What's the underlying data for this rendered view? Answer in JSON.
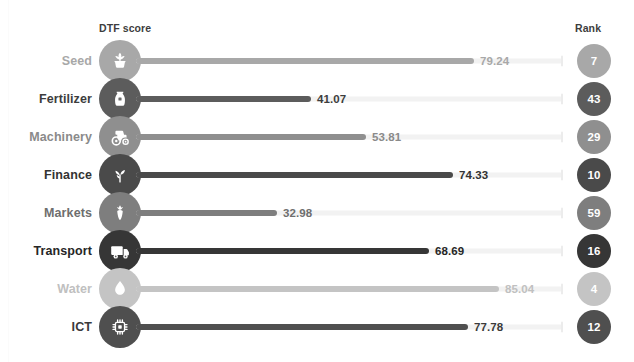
{
  "header": {
    "score_label": "DTF score",
    "rank_label": "Rank"
  },
  "chart_data": {
    "type": "bar",
    "title": "",
    "subtitle": "",
    "xlabel": "DTF score",
    "ylabel": "",
    "xlim": [
      0,
      100
    ],
    "grid": false,
    "legend": null,
    "orientation": "horizontal",
    "categories": [
      "Seed",
      "Fertilizer",
      "Machinery",
      "Finance",
      "Markets",
      "Transport",
      "Water",
      "ICT"
    ],
    "values": [
      79.24,
      41.07,
      53.81,
      74.33,
      32.98,
      68.69,
      85.04,
      77.78
    ],
    "ranks": [
      7,
      43,
      29,
      10,
      59,
      16,
      4,
      12
    ],
    "value_labels": [
      "79.24",
      "41.07",
      "53.81",
      "74.33",
      "32.98",
      "68.69",
      "85.04",
      "77.78"
    ],
    "rank_labels": [
      "7",
      "43",
      "29",
      "10",
      "59",
      "16",
      "4",
      "12"
    ],
    "series": [
      {
        "name": "DTF score",
        "values": [
          79.24,
          41.07,
          53.81,
          74.33,
          32.98,
          68.69,
          85.04,
          77.78
        ]
      }
    ]
  },
  "rows": [
    {
      "label": "Seed",
      "value": "79.24",
      "value_num": 79.24,
      "rank": "7",
      "icon": "seedling-pot-icon",
      "color": "#a8a8a8",
      "label_color": "#a8a8a8"
    },
    {
      "label": "Fertilizer",
      "value": "41.07",
      "value_num": 41.07,
      "rank": "43",
      "icon": "fertilizer-sack-icon",
      "color": "#5c5c5c",
      "label_color": "#3d3d3d"
    },
    {
      "label": "Machinery",
      "value": "53.81",
      "value_num": 53.81,
      "rank": "29",
      "icon": "tractor-icon",
      "color": "#8f8f8f",
      "label_color": "#8a8a8a"
    },
    {
      "label": "Finance",
      "value": "74.33",
      "value_num": 74.33,
      "rank": "10",
      "icon": "coin-plant-icon",
      "color": "#4a4a4a",
      "label_color": "#333333"
    },
    {
      "label": "Markets",
      "value": "32.98",
      "value_num": 32.98,
      "rank": "59",
      "icon": "carrot-produce-icon",
      "color": "#7e7e7e",
      "label_color": "#6e6e6e"
    },
    {
      "label": "Transport",
      "value": "68.69",
      "value_num": 68.69,
      "rank": "16",
      "icon": "delivery-truck-icon",
      "color": "#363636",
      "label_color": "#262626"
    },
    {
      "label": "Water",
      "value": "85.04",
      "value_num": 85.04,
      "rank": "4",
      "icon": "water-drop-icon",
      "color": "#c4c4c4",
      "label_color": "#c0c0c0"
    },
    {
      "label": "ICT",
      "value": "77.78",
      "value_num": 77.78,
      "rank": "12",
      "icon": "microchip-icon",
      "color": "#4f4f4f",
      "label_color": "#3a3a3a"
    }
  ],
  "colors": {
    "track": "#f2f2f2",
    "track_cap": "#ececec",
    "background": "#ffffff",
    "header_text": "#3d3d3d"
  }
}
